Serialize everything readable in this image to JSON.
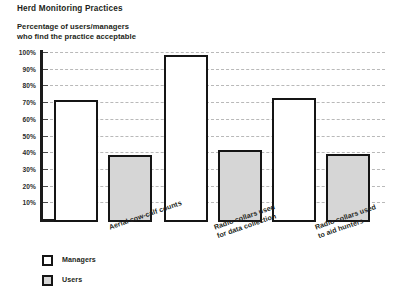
{
  "chart_data": {
    "type": "bar",
    "title": "Herd Monitoring Practices",
    "subtitle": "Percentage of users/managers\nwho find the practice acceptable",
    "xlabel": "",
    "ylabel": "",
    "ylim": [
      0,
      100
    ],
    "grid": true,
    "legend_position": "bottom-left",
    "ytick_labels": [
      "100%",
      "90%",
      "80%",
      "70%",
      "60%",
      "50%",
      "40%",
      "30%",
      "20%",
      "10%"
    ],
    "ytick_values": [
      100,
      90,
      80,
      70,
      60,
      50,
      40,
      30,
      20,
      10
    ],
    "categories": [
      "Aerial cow-calf counts",
      "Radio collars used\nfor data collection",
      "Radio collars used\nto aid hunters"
    ],
    "series": [
      {
        "name": "Managers",
        "color": "#ffffff",
        "values": [
          73,
          100,
          74
        ]
      },
      {
        "name": "Users",
        "color": "#d6d6d6",
        "values": [
          40,
          43,
          41
        ]
      }
    ]
  },
  "legend": {
    "items": [
      {
        "label": "Managers",
        "swatch": "white-square-icon"
      },
      {
        "label": "Users",
        "swatch": "gray-square-icon"
      }
    ]
  }
}
